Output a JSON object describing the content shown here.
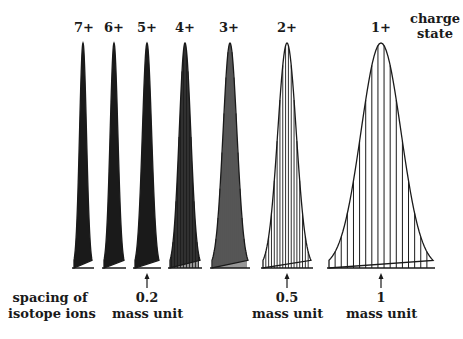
{
  "figure": {
    "legend_label": "charge state",
    "legend_lines": [
      "charge",
      "state"
    ],
    "spacing_label_lines": [
      "spacing of",
      "isotope ions"
    ],
    "baseline_y": 268,
    "peak_top_y": 43,
    "line_color": "#1a1a1a"
  },
  "peaks": [
    {
      "charge": "7+",
      "cx": 83,
      "half_width": 9,
      "sticks": 0,
      "label_x": 83
    },
    {
      "charge": "6+",
      "cx": 114,
      "half_width": 10,
      "sticks": 0,
      "label_x": 114
    },
    {
      "charge": "5+",
      "cx": 147,
      "half_width": 12,
      "sticks": 0,
      "label_x": 147
    },
    {
      "charge": "4+",
      "cx": 185,
      "half_width": 15,
      "sticks": 20,
      "label_x": 185
    },
    {
      "charge": "3+",
      "cx": 230,
      "half_width": 18,
      "sticks": 18,
      "label_x": 229
    },
    {
      "charge": "2+",
      "cx": 287,
      "half_width": 24,
      "sticks": 17,
      "label_x": 287
    },
    {
      "charge": "1+",
      "cx": 381,
      "half_width": 52,
      "sticks": 17,
      "label_x": 381
    }
  ],
  "annotations": [
    {
      "x": 147,
      "value": "0.2",
      "unit": "mass unit"
    },
    {
      "x": 287,
      "value": "0.5",
      "unit": "mass unit"
    },
    {
      "x": 381,
      "value": "1",
      "unit": "mass unit"
    }
  ]
}
